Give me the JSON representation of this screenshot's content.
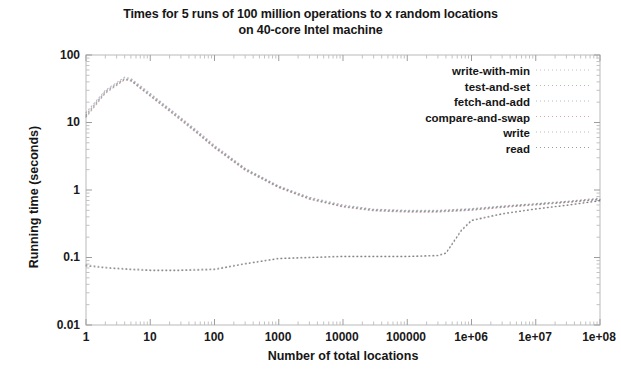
{
  "chart_data": {
    "type": "line",
    "title": "Times for 5 runs of 100 million operations to x random locations on 40-core Intel machine",
    "title_line1": "Times for 5 runs of 100 million operations to x random locations",
    "title_line2": "on 40-core Intel machine",
    "xlabel": "Number of total locations",
    "ylabel": "Running time (seconds)",
    "xscale": "log",
    "yscale": "log",
    "xlim": [
      1,
      100000000
    ],
    "ylim": [
      0.01,
      100
    ],
    "grid": false,
    "legend_position": "inside top-right",
    "xtick_labels": [
      "1",
      "10",
      "100",
      "1000",
      "10000",
      "100000",
      "1e+06",
      "1e+07",
      "1e+08"
    ],
    "xtick_values": [
      1,
      10,
      100,
      1000,
      10000,
      100000,
      1000000,
      10000000,
      100000000
    ],
    "ytick_labels": [
      "100",
      "10",
      "1",
      "0.1",
      "0.01"
    ],
    "ytick_values": [
      100,
      10,
      1,
      0.1,
      0.01
    ],
    "series": [
      {
        "name": "write-with-min",
        "color": "#9a6ab0",
        "dash": "1 3",
        "x": [
          1,
          2,
          4,
          5,
          10,
          20,
          50,
          100,
          300,
          1000,
          3000,
          10000,
          30000,
          100000,
          300000,
          1000000,
          3000000,
          10000000,
          30000000,
          100000000
        ],
        "y": [
          14.0,
          30.0,
          47.0,
          45.0,
          27.0,
          16.0,
          8.0,
          4.6,
          2.1,
          1.15,
          0.78,
          0.6,
          0.52,
          0.5,
          0.5,
          0.53,
          0.58,
          0.63,
          0.68,
          0.76
        ]
      },
      {
        "name": "test-and-set",
        "color": "#5a8f3c",
        "dash": "1 3",
        "x": [
          1,
          2,
          4,
          5,
          10,
          20,
          50,
          100,
          300,
          1000,
          3000,
          10000,
          30000,
          100000,
          300000,
          1000000,
          3000000,
          10000000,
          30000000,
          100000000
        ],
        "y": [
          13.0,
          29.0,
          45.0,
          43.0,
          26.0,
          15.5,
          7.7,
          4.4,
          2.05,
          1.12,
          0.76,
          0.58,
          0.51,
          0.49,
          0.49,
          0.52,
          0.57,
          0.62,
          0.67,
          0.74
        ]
      },
      {
        "name": "fetch-and-add",
        "color": "#4d7fb5",
        "dash": "1 3",
        "x": [
          1,
          2,
          4,
          5,
          10,
          20,
          50,
          100,
          300,
          1000,
          3000,
          10000,
          30000,
          100000,
          300000,
          1000000,
          3000000,
          10000000,
          30000000,
          100000000
        ],
        "y": [
          12.5,
          28.0,
          44.0,
          42.0,
          25.0,
          15.0,
          7.5,
          4.3,
          2.0,
          1.1,
          0.74,
          0.57,
          0.5,
          0.48,
          0.48,
          0.51,
          0.56,
          0.61,
          0.66,
          0.73
        ]
      },
      {
        "name": "compare-and-swap",
        "color": "#b05a5a",
        "dash": "1 3",
        "x": [
          1,
          2,
          4,
          5,
          10,
          20,
          50,
          100,
          300,
          1000,
          3000,
          10000,
          30000,
          100000,
          300000,
          1000000,
          3000000,
          10000000,
          30000000,
          100000000
        ],
        "y": [
          12.0,
          27.0,
          43.0,
          41.0,
          24.5,
          14.6,
          7.3,
          4.2,
          1.95,
          1.08,
          0.73,
          0.56,
          0.49,
          0.47,
          0.47,
          0.5,
          0.55,
          0.6,
          0.65,
          0.72
        ]
      },
      {
        "name": "write",
        "color": "#7a7a7a",
        "dash": "1 3",
        "x": [
          1,
          2,
          5,
          10,
          30,
          100,
          300,
          1000,
          10000,
          100000,
          300000,
          400000,
          700000,
          1000000,
          3000000,
          10000000,
          30000000,
          100000000
        ],
        "y": [
          0.078,
          0.072,
          0.068,
          0.066,
          0.066,
          0.068,
          0.082,
          0.098,
          0.105,
          0.105,
          0.108,
          0.118,
          0.26,
          0.36,
          0.45,
          0.53,
          0.6,
          0.7
        ]
      },
      {
        "name": "read",
        "color": "#3a3a3a",
        "dash": "1 3",
        "x": [
          1,
          2,
          5,
          10,
          30,
          100,
          300,
          1000,
          10000,
          100000,
          300000,
          400000,
          700000,
          1000000,
          3000000,
          10000000,
          30000000,
          100000000
        ],
        "y": [
          0.075,
          0.07,
          0.066,
          0.064,
          0.064,
          0.066,
          0.08,
          0.096,
          0.103,
          0.103,
          0.106,
          0.115,
          0.25,
          0.35,
          0.44,
          0.52,
          0.59,
          0.69
        ]
      }
    ]
  },
  "axes": {
    "y_ticks": [
      "100",
      "10",
      "1",
      "0.1",
      "0.01"
    ],
    "x_ticks": [
      "1",
      "10",
      "100",
      "1000",
      "10000",
      "100000",
      "1e+06",
      "1e+07",
      "1e+08"
    ],
    "x_axis_title": "Number of total locations",
    "y_axis_title": "Running time (seconds)"
  },
  "legend": {
    "items": [
      {
        "label": "write-with-min"
      },
      {
        "label": "test-and-set"
      },
      {
        "label": "fetch-and-add"
      },
      {
        "label": "compare-and-swap"
      },
      {
        "label": "write"
      },
      {
        "label": "read"
      }
    ]
  }
}
